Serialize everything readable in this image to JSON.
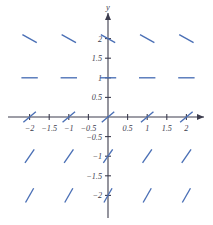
{
  "figure": {
    "title": "",
    "axis_color": "#3d3d4e",
    "slope_color": "#4a6fb5",
    "background": "#ffffff"
  },
  "chart_data": {
    "type": "scatter",
    "title": "",
    "xlabel": "",
    "ylabel": "y",
    "xlim": [
      -2.45,
      2.45
    ],
    "ylim": [
      -2.45,
      2.45
    ],
    "grid": false,
    "legend": null,
    "x_ticks": [
      -2,
      -1.5,
      -1,
      -0.5,
      0.5,
      1,
      1.5,
      2
    ],
    "x_tick_labels": [
      "−2",
      "−1.5",
      "−1",
      "−0.5",
      "0.5",
      "1",
      "1.5",
      "2"
    ],
    "y_ticks": [
      2,
      1.5,
      1,
      0.5,
      -0.5,
      -1,
      -1.5,
      -2
    ],
    "y_tick_labels": [
      "2",
      "1.5",
      "1",
      "0.5",
      "−0.5",
      "−1",
      "−1.5",
      "−2"
    ],
    "sample_x": [
      -2,
      -1,
      0,
      1,
      2
    ],
    "sample_y": [
      2,
      1,
      0,
      -1,
      -2
    ],
    "rows": [
      {
        "y": 2,
        "slope": -0.55,
        "slope_label": "negative",
        "x_values": [
          -2,
          -1,
          0,
          1,
          2
        ]
      },
      {
        "y": 1,
        "slope": 0,
        "slope_label": "zero",
        "x_values": [
          -2,
          -1,
          0,
          1,
          2
        ]
      },
      {
        "y": 0,
        "slope": 0.85,
        "slope_label": "positive",
        "x_values": [
          -2,
          -1,
          0,
          1,
          2
        ]
      },
      {
        "y": -1,
        "slope": 1.45,
        "slope_label": "positive-steep",
        "x_values": [
          -2,
          -1,
          0,
          1,
          2
        ]
      },
      {
        "y": -2,
        "slope": 1.75,
        "slope_label": "positive-steeper",
        "x_values": [
          -2,
          -1,
          0,
          1,
          2
        ]
      }
    ],
    "segments": [
      {
        "x": -2,
        "y": 2,
        "slope": -0.55
      },
      {
        "x": -1,
        "y": 2,
        "slope": -0.55
      },
      {
        "x": 0,
        "y": 2,
        "slope": -0.55
      },
      {
        "x": 1,
        "y": 2,
        "slope": -0.55
      },
      {
        "x": 2,
        "y": 2,
        "slope": -0.55
      },
      {
        "x": -2,
        "y": 1,
        "slope": 0
      },
      {
        "x": -1,
        "y": 1,
        "slope": 0
      },
      {
        "x": 0,
        "y": 1,
        "slope": 0
      },
      {
        "x": 1,
        "y": 1,
        "slope": 0
      },
      {
        "x": 2,
        "y": 1,
        "slope": 0
      },
      {
        "x": -2,
        "y": 0,
        "slope": 0.85
      },
      {
        "x": -1,
        "y": 0,
        "slope": 0.85
      },
      {
        "x": 0,
        "y": 0,
        "slope": 0.85
      },
      {
        "x": 1,
        "y": 0,
        "slope": 0.85
      },
      {
        "x": 2,
        "y": 0,
        "slope": 0.85
      },
      {
        "x": -2,
        "y": -1,
        "slope": 1.45
      },
      {
        "x": -1,
        "y": -1,
        "slope": 1.45
      },
      {
        "x": 0,
        "y": -1,
        "slope": 1.45
      },
      {
        "x": 1,
        "y": -1,
        "slope": 1.45
      },
      {
        "x": 2,
        "y": -1,
        "slope": 1.45
      },
      {
        "x": -2,
        "y": -2,
        "slope": 1.75
      },
      {
        "x": -1,
        "y": -2,
        "slope": 1.75
      },
      {
        "x": 0,
        "y": -2,
        "slope": 1.75
      },
      {
        "x": 1,
        "y": -2,
        "slope": 1.75
      },
      {
        "x": 2,
        "y": -2,
        "slope": 1.75
      }
    ]
  },
  "labels": {
    "y_axis_name": "y",
    "x_axis_name": ""
  }
}
